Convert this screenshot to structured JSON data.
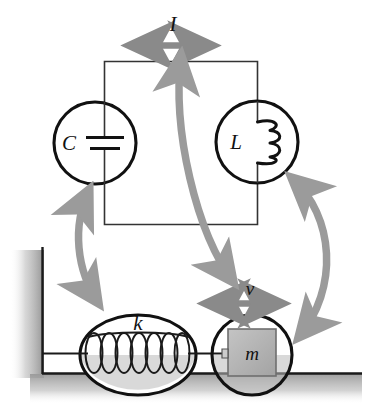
{
  "figure": {
    "background_color": "#ffffff",
    "width": 369,
    "height": 416
  },
  "colors": {
    "stroke": "#111111",
    "arrow_gray": "#8a8a8a",
    "arrow_gray_light": "#9b9b9b",
    "block_fill": "#b2b2b2",
    "block_stroke": "#6f6f6f",
    "ground_shade": "#a9a9a9",
    "wall_shade": "#bdbdbd",
    "spring_stroke": "#1a1a1a"
  },
  "circuit": {
    "name": "lc-circuit",
    "current_label": "I",
    "capacitor": {
      "label": "C",
      "symbol": "capacitor-plates"
    },
    "inductor": {
      "label": "L",
      "symbol": "coil-windings",
      "turns": 3
    },
    "loop": {
      "x": 104,
      "y": 61,
      "width": 153,
      "height": 163
    }
  },
  "mechanical": {
    "name": "mass-spring-system",
    "velocity_label": "v",
    "spring": {
      "label": "k",
      "symbol": "helical-spring",
      "coils": 7
    },
    "mass": {
      "label": "m",
      "symbol": "block"
    },
    "wall": {
      "x": 42,
      "y_top": 247,
      "y_bottom": 373
    },
    "ground": {
      "y": 373,
      "x_start": 42,
      "x_end": 362
    }
  },
  "arrows": [
    {
      "name": "current-double-arrow",
      "kind": "straight-double",
      "label": "I",
      "orientation": "horizontal"
    },
    {
      "name": "velocity-double-arrow",
      "kind": "straight-double",
      "label": "v",
      "orientation": "horizontal"
    },
    {
      "name": "capacitor-spring-correspondence-arrow",
      "kind": "curved-double",
      "from": "C",
      "to": "k"
    },
    {
      "name": "current-velocity-correspondence-arrow",
      "kind": "curved-double",
      "from": "I",
      "to": "v"
    },
    {
      "name": "inductor-mass-correspondence-arrow",
      "kind": "curved-double",
      "from": "L",
      "to": "m"
    }
  ]
}
